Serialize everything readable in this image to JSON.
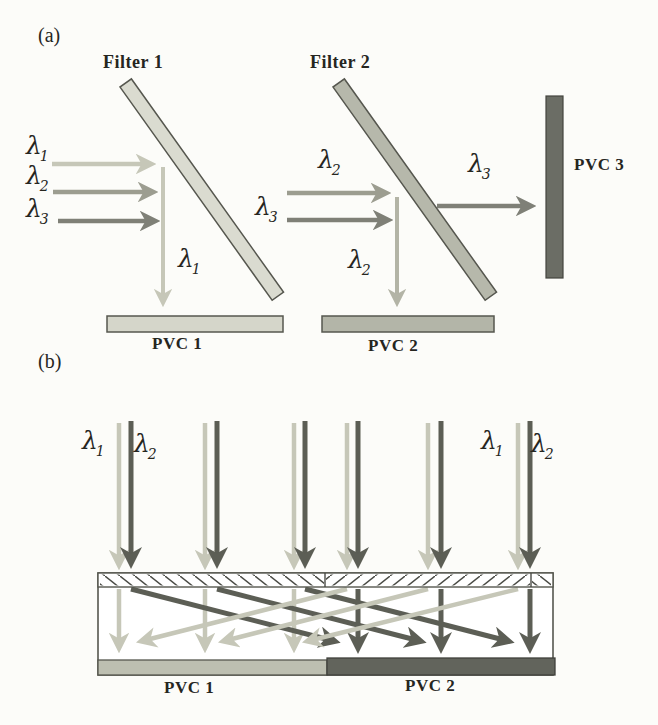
{
  "panel_a": {
    "label": "(a)",
    "filter1": "Filter 1",
    "filter2": "Filter 2",
    "pvc1": "PVC 1",
    "pvc2": "PVC 2",
    "pvc3": "PVC 3"
  },
  "panel_b": {
    "label": "(b)",
    "pvc1": "PVC 1",
    "pvc2": "PVC 2"
  },
  "lambdas": {
    "a_in_1": {
      "base": "λ",
      "sub": "1"
    },
    "a_in_2": {
      "base": "λ",
      "sub": "2"
    },
    "a_in_3": {
      "base": "λ",
      "sub": "3"
    },
    "a_down_1": {
      "base": "λ",
      "sub": "1"
    },
    "a_f2_in_2": {
      "base": "λ",
      "sub": "2"
    },
    "a_f2_in_3": {
      "base": "λ",
      "sub": "3"
    },
    "a_out_3": {
      "base": "λ",
      "sub": "3"
    },
    "a_down_2": {
      "base": "λ",
      "sub": "2"
    },
    "b_left_1": {
      "base": "λ",
      "sub": "1"
    },
    "b_left_2": {
      "base": "λ",
      "sub": "2"
    },
    "b_right_1": {
      "base": "λ",
      "sub": "1"
    },
    "b_right_2": {
      "base": "λ",
      "sub": "2"
    }
  },
  "colors": {
    "bg": "#fcfcf9",
    "ink": "#26261f",
    "outline": "#56574f",
    "light_ray": "#c6c7b8",
    "mid_ray": "#9c9d90",
    "midlight_ray": "#b3b4a6",
    "dark_ray": "#7f8077",
    "b_dark_ray": "#5c5e55",
    "filter1_fill": "#dadbd0",
    "filter2_fill": "#b6b8ab",
    "pvc1a_fill": "#d5d6ca",
    "pvc2a_fill": "#b3b5a8",
    "pvc3_fill": "#6b6d65",
    "b_pvc1_fill": "#bdbfb1",
    "b_pvc2_fill": "#62645c"
  }
}
